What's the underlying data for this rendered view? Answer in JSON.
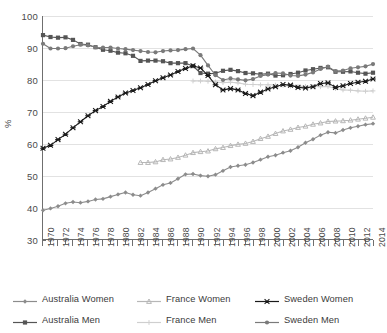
{
  "chart_data": {
    "type": "line",
    "title": "",
    "xlabel": "",
    "ylabel": "%",
    "ylim": [
      30,
      100
    ],
    "ytick_step": 10,
    "yticks": [
      100,
      90,
      80,
      70,
      60,
      50,
      40,
      30
    ],
    "xlim": [
      1970,
      2014
    ],
    "grid": "horizontal",
    "legend_position": "bottom",
    "x": [
      1970,
      1971,
      1972,
      1973,
      1974,
      1975,
      1976,
      1977,
      1978,
      1979,
      1980,
      1981,
      1982,
      1983,
      1984,
      1985,
      1986,
      1987,
      1988,
      1989,
      1990,
      1991,
      1992,
      1993,
      1994,
      1995,
      1996,
      1997,
      1998,
      1999,
      2000,
      2001,
      2002,
      2003,
      2004,
      2005,
      2006,
      2007,
      2008,
      2009,
      2010,
      2011,
      2012,
      2013,
      2014
    ],
    "xtick_labels": [
      "1970",
      "1972",
      "1974",
      "1976",
      "1978",
      "1980",
      "1982",
      "1984",
      "1986",
      "1988",
      "1990",
      "1992",
      "1994",
      "1996",
      "1998",
      "2000",
      "2002",
      "2004",
      "2006",
      "2008",
      "2010",
      "2012",
      "2014"
    ],
    "series": [
      {
        "name": "Australia Women",
        "color": "#8c8c8c",
        "marker": "diamond",
        "values": [
          39.0,
          39.6,
          40.3,
          41.2,
          41.6,
          41.4,
          41.8,
          42.4,
          42.6,
          43.3,
          44.0,
          44.6,
          43.9,
          43.6,
          44.6,
          45.8,
          47.0,
          47.6,
          48.9,
          50.3,
          50.4,
          49.9,
          49.7,
          50.2,
          51.4,
          52.6,
          53.0,
          53.3,
          54.0,
          54.9,
          55.8,
          56.3,
          57.1,
          57.7,
          58.8,
          60.2,
          61.3,
          62.6,
          63.5,
          63.3,
          64.2,
          64.9,
          65.4,
          65.9,
          66.2
        ]
      },
      {
        "name": "Australia Men",
        "color": "#555555",
        "marker": "square",
        "values": [
          94.0,
          93.4,
          93.2,
          93.3,
          92.5,
          91.2,
          91.0,
          90.2,
          89.4,
          89.1,
          88.5,
          88.3,
          87.5,
          85.9,
          86.0,
          86.0,
          85.8,
          85.2,
          85.2,
          85.2,
          84.3,
          82.1,
          81.9,
          82.0,
          82.8,
          83.1,
          82.7,
          82.1,
          82.0,
          81.7,
          81.9,
          81.3,
          81.4,
          81.8,
          82.2,
          82.9,
          83.3,
          83.7,
          83.9,
          82.5,
          82.5,
          82.6,
          82.2,
          81.9,
          82.2
        ]
      },
      {
        "name": "France Women",
        "color": "#b7b7b7",
        "marker": "triangle",
        "values": [
          null,
          null,
          null,
          null,
          null,
          null,
          null,
          null,
          null,
          null,
          null,
          null,
          null,
          54.0,
          54.0,
          54.2,
          54.9,
          55.1,
          55.6,
          56.3,
          57.1,
          57.4,
          57.6,
          58.3,
          58.7,
          59.3,
          59.7,
          60.0,
          60.6,
          61.5,
          62.2,
          63.1,
          63.9,
          64.4,
          65.0,
          65.4,
          66.0,
          66.4,
          66.9,
          67.0,
          67.1,
          67.3,
          67.6,
          67.9,
          68.2
        ]
      },
      {
        "name": "France Men",
        "color": "#cfcfcf",
        "marker": "plus",
        "values": [
          null,
          null,
          null,
          null,
          null,
          null,
          null,
          null,
          null,
          null,
          null,
          null,
          null,
          null,
          null,
          null,
          null,
          null,
          null,
          null,
          79.6,
          79.6,
          79.5,
          79.3,
          79.1,
          79.2,
          79.0,
          78.6,
          78.5,
          78.4,
          78.4,
          78.3,
          78.2,
          78.0,
          77.9,
          77.9,
          77.9,
          77.8,
          77.9,
          77.2,
          76.8,
          76.7,
          76.5,
          76.4,
          76.5
        ]
      },
      {
        "name": "Sweden Women",
        "color": "#1a1a1a",
        "marker": "star",
        "values": [
          58.5,
          59.4,
          61.2,
          62.9,
          64.9,
          66.8,
          68.7,
          70.3,
          71.6,
          73.2,
          74.6,
          75.8,
          76.6,
          77.5,
          78.5,
          79.7,
          80.6,
          81.5,
          82.6,
          83.5,
          84.4,
          83.7,
          81.3,
          78.4,
          76.8,
          77.2,
          76.8,
          75.7,
          75.0,
          76.1,
          77.1,
          77.8,
          78.5,
          78.3,
          77.6,
          77.4,
          77.8,
          78.8,
          79.0,
          77.6,
          78.1,
          78.8,
          79.2,
          79.5,
          80.2
        ]
      },
      {
        "name": "Sweden Men",
        "color": "#7a7a7a",
        "marker": "circle",
        "values": [
          91.3,
          89.8,
          89.8,
          89.9,
          90.5,
          91.0,
          90.8,
          90.2,
          90.1,
          90.1,
          89.8,
          89.6,
          89.3,
          89.0,
          88.7,
          88.6,
          89.0,
          89.2,
          89.3,
          89.6,
          89.8,
          87.7,
          84.5,
          81.4,
          79.9,
          80.4,
          80.1,
          79.8,
          80.2,
          81.2,
          81.6,
          82.1,
          82.0,
          81.3,
          81.2,
          81.6,
          82.3,
          83.4,
          84.1,
          82.7,
          82.9,
          83.6,
          83.9,
          84.2,
          84.9
        ]
      }
    ]
  },
  "legend": {
    "items": [
      {
        "label": "Australia Women"
      },
      {
        "label": "France Women"
      },
      {
        "label": "Sweden Women"
      },
      {
        "label": "Australia Men"
      },
      {
        "label": "France Men"
      },
      {
        "label": "Sweden Men"
      }
    ]
  }
}
